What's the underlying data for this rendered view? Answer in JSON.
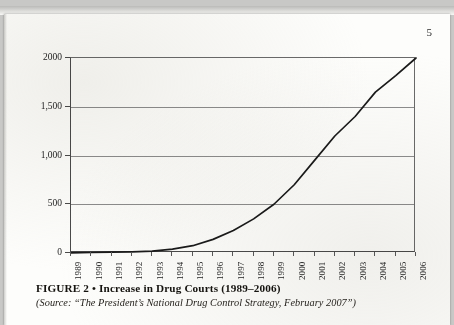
{
  "page": {
    "number": "5"
  },
  "caption": {
    "figure_label": "FIGURE 2 • Increase in Drug Courts (1989–2006)",
    "source_note": "(Source: “The President’s National Drug Control Strategy, February 2007”)"
  },
  "colors": {
    "line": "#1a1a1a",
    "gridline": "#8d8d8d",
    "axis": "#4a4a4a",
    "text": "#1d1d1d",
    "paper": "#fdfdfb"
  },
  "chart_data": {
    "type": "line",
    "title": "",
    "xlabel": "",
    "ylabel": "",
    "categories": [
      "1989",
      "1990",
      "1991",
      "1992",
      "1993",
      "1994",
      "1995",
      "1996",
      "1997",
      "1998",
      "1999",
      "2000",
      "2001",
      "2002",
      "2003",
      "2004",
      "2005",
      "2006"
    ],
    "values": [
      1,
      5,
      8,
      12,
      20,
      40,
      75,
      140,
      230,
      350,
      500,
      700,
      950,
      1200,
      1400,
      1650,
      1820,
      2000
    ],
    "ytick_labels": [
      "2000",
      "1,500",
      "1,000",
      "500",
      "0"
    ],
    "ytick_values": [
      2000,
      1500,
      1000,
      500,
      0
    ],
    "ylim": [
      0,
      2000
    ],
    "xlim": [
      "1989",
      "2006"
    ],
    "grid": true,
    "legend": "none",
    "series": [
      {
        "name": "Number of Drug Courts",
        "values": [
          1,
          5,
          8,
          12,
          20,
          40,
          75,
          140,
          230,
          350,
          500,
          700,
          950,
          1200,
          1400,
          1650,
          1820,
          2000
        ]
      }
    ]
  }
}
